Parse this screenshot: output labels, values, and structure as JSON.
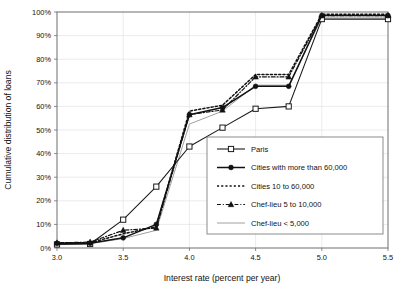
{
  "chart_data": {
    "type": "line",
    "title": "",
    "xlabel": "Interest rate (percent per year)",
    "ylabel": "Cumulative distribution of loans",
    "xlim": [
      3.0,
      5.5
    ],
    "ylim": [
      0,
      100
    ],
    "grid": true,
    "legend_position": "inside-lower-right",
    "x_ticks": [
      "3.0",
      "3.5",
      "4.0",
      "4.5",
      "5.0",
      "5.5"
    ],
    "x_tick_values": [
      3.0,
      3.5,
      4.0,
      4.5,
      5.0,
      5.5
    ],
    "y_ticks": [
      "0%",
      "10%",
      "20%",
      "30%",
      "40%",
      "50%",
      "60%",
      "70%",
      "80%",
      "90%",
      "100%"
    ],
    "y_tick_values": [
      0,
      10,
      20,
      30,
      40,
      50,
      60,
      70,
      80,
      90,
      100
    ],
    "x": [
      3.0,
      3.25,
      3.5,
      3.75,
      4.0,
      4.25,
      4.5,
      4.75,
      5.0,
      5.5
    ],
    "series": [
      {
        "name": "Paris",
        "marker": "open-square",
        "dash": "solid",
        "color": "#1a1a1a",
        "width": 1.1,
        "values": [
          1.5,
          1.7,
          12.0,
          26.0,
          43.0,
          51.0,
          59.0,
          60.0,
          97.0,
          97.0
        ]
      },
      {
        "name": "Cities with more than 60,000",
        "marker": "filled-circle",
        "dash": "solid",
        "color": "#111111",
        "width": 1.5,
        "values": [
          2.0,
          2.0,
          4.3,
          10.0,
          56.5,
          59.5,
          68.5,
          68.5,
          98.5,
          98.5
        ]
      },
      {
        "name": "Cities 10 to 60,000",
        "marker": "none",
        "dash": "dotted",
        "color": "#111111",
        "width": 1.5,
        "values": [
          2.2,
          2.2,
          6.0,
          9.0,
          58.0,
          60.5,
          73.5,
          73.5,
          99.0,
          99.0
        ]
      },
      {
        "name": "Chef-lieu 5 to 10,000",
        "marker": "filled-triangle",
        "dash": "dash-dot",
        "color": "#111111",
        "width": 1.2,
        "values": [
          2.2,
          2.5,
          7.5,
          8.5,
          56.5,
          58.5,
          72.5,
          72.5,
          98.5,
          98.5
        ]
      },
      {
        "name": "Chef-lieu < 5,000",
        "marker": "none",
        "dash": "solid",
        "color": "#a0a0a0",
        "width": 1.0,
        "values": [
          1.5,
          1.8,
          4.0,
          7.5,
          52.5,
          58.0,
          69.0,
          69.0,
          97.5,
          97.5
        ]
      }
    ]
  },
  "legend": {
    "items": [
      {
        "label": "Paris"
      },
      {
        "label": "Cities with more than 60,000"
      },
      {
        "label": "Cities 10 to 60,000"
      },
      {
        "label": "Chef-lieu 5 to 10,000"
      },
      {
        "label": "Chef-lieu < 5,000"
      }
    ]
  }
}
